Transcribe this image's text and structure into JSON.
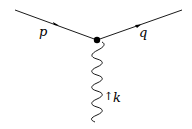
{
  "diagram": {
    "type": "feynman-vertex",
    "lines": [
      {
        "id": "incoming-fermion",
        "label": "p",
        "style": "solid",
        "arrow": "forward"
      },
      {
        "id": "outgoing-fermion",
        "label": "q",
        "style": "solid",
        "arrow": "forward"
      },
      {
        "id": "photon",
        "label": "k",
        "style": "wavy",
        "arrow": "up"
      }
    ],
    "labels": {
      "p": "p",
      "q": "q",
      "k": "k",
      "k_arrow": "↑"
    }
  }
}
